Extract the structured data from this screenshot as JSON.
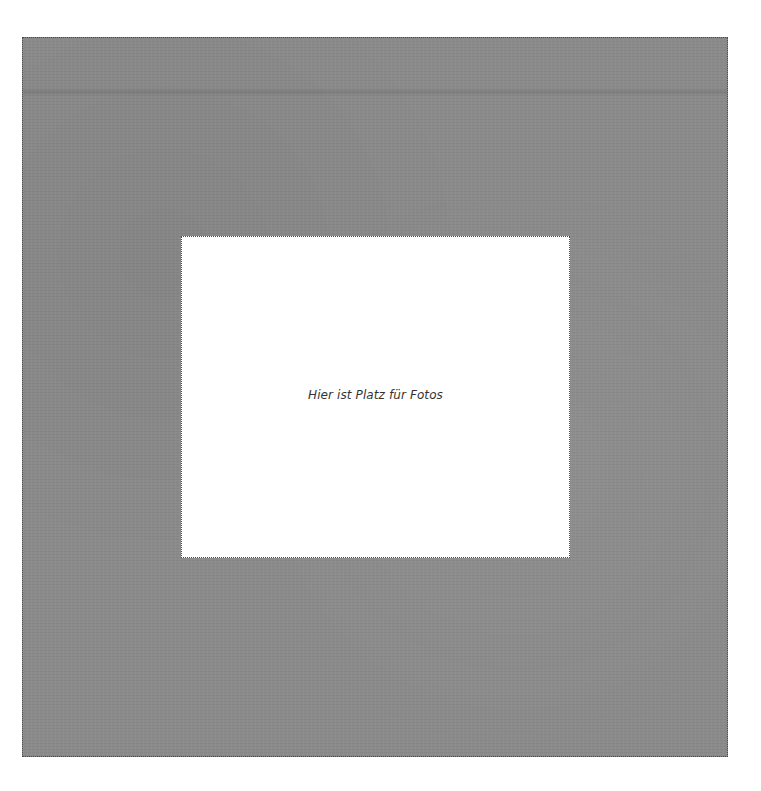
{
  "frame": {
    "background_color": "#8b8b8b",
    "border_style": "dotted"
  },
  "placeholder": {
    "text": "Hier ist Platz für Fotos",
    "background_color": "#ffffff",
    "text_color": "#333333"
  }
}
